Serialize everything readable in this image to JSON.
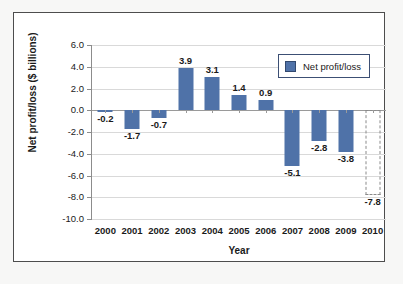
{
  "chart_data": {
    "type": "bar",
    "title": "",
    "xlabel": "Year",
    "ylabel": "Net profit/loss ($ billions)",
    "categories": [
      "2000",
      "2001",
      "2002",
      "2003",
      "2004",
      "2005",
      "2006",
      "2007",
      "2008",
      "2009",
      "2010"
    ],
    "values": [
      -0.2,
      -1.7,
      -0.7,
      3.9,
      3.1,
      1.4,
      0.9,
      -5.1,
      -2.8,
      -3.8,
      -7.8
    ],
    "value_labels": [
      "-0.2",
      "-1.7",
      "-0.7",
      "3.9",
      "3.1",
      "1.4",
      "0.9",
      "-5.1",
      "-2.8",
      "-3.8",
      "-7.8"
    ],
    "bar_styles": [
      "solid",
      "solid",
      "solid",
      "solid",
      "solid",
      "solid",
      "solid",
      "solid",
      "solid",
      "solid",
      "dashed"
    ],
    "ylim": [
      -10.0,
      6.0
    ],
    "ytick_labels": [
      "6.0",
      "4.0",
      "2.0",
      "0.0",
      "-2.0",
      "-4.0",
      "-6.0",
      "-8.0",
      "-10.0"
    ],
    "ytick_values": [
      6.0,
      4.0,
      2.0,
      0.0,
      -2.0,
      -4.0,
      -6.0,
      -8.0,
      -10.0
    ],
    "grid": true,
    "legend": {
      "position": "top-right",
      "entries": [
        {
          "label": "Net profit/loss",
          "color": "#4f72a8"
        }
      ]
    },
    "series": [
      {
        "name": "Net profit/loss",
        "color": "#4f72a8",
        "values": [
          -0.2,
          -1.7,
          -0.7,
          3.9,
          3.1,
          1.4,
          0.9,
          -5.1,
          -2.8,
          -3.8,
          -7.8
        ]
      }
    ]
  },
  "colors": {
    "bar_fill": "#4f72a8",
    "legend_border": "#3c4f74",
    "gridline": "#d9d9d9",
    "axis": "#8c8c8c",
    "frame_border": "#4d4d4d",
    "text": "#1a1a1a"
  }
}
